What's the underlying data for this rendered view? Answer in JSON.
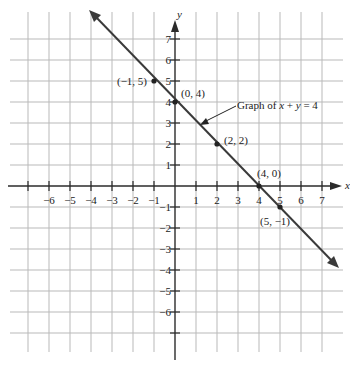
{
  "graph": {
    "title": "Graph of x + y = 4",
    "annotation": {
      "prefix": "Graph of ",
      "x": "x",
      "plus": " + ",
      "y": "y",
      "eq": " = 4"
    },
    "x_axis_label": "x",
    "y_axis_label": "y",
    "x_ticks": [
      "-6",
      "-5",
      "-4",
      "-3",
      "-2",
      "-1",
      "1",
      "2",
      "3",
      "4",
      "5",
      "6",
      "7"
    ],
    "y_ticks": [
      "7",
      "6",
      "5",
      "4",
      "3",
      "2",
      "1",
      "-1",
      "-2",
      "-3",
      "-4",
      "-5",
      "-6"
    ],
    "points": [
      {
        "label": "(−1, 5)",
        "x": -1,
        "y": 5
      },
      {
        "label": "(0, 4)",
        "x": 0,
        "y": 4
      },
      {
        "label": "(2, 2)",
        "x": 2,
        "y": 2
      },
      {
        "label": "(4, 0)",
        "x": 4,
        "y": 0
      },
      {
        "label": "(5, −1)",
        "x": 5,
        "y": -1
      }
    ],
    "colors": {
      "grid": "#b9b9b9",
      "axis": "#2b2b2b",
      "line": "#3a3a3a",
      "background": "#ffffff"
    }
  },
  "chart_data": {
    "type": "line",
    "title": "Graph of x + y = 4",
    "equation": "x + y = 4",
    "xlabel": "x",
    "ylabel": "y",
    "xlim": [
      -7,
      8
    ],
    "ylim": [
      -7,
      8
    ],
    "grid": true,
    "series": [
      {
        "name": "x + y = 4",
        "x": [
          -1,
          0,
          2,
          4,
          5
        ],
        "y": [
          5,
          4,
          2,
          0,
          -1
        ]
      }
    ],
    "annotations": [
      "(−1, 5)",
      "(0, 4)",
      "(2, 2)",
      "(4, 0)",
      "(5, −1)",
      "Graph of x + y = 4"
    ]
  }
}
